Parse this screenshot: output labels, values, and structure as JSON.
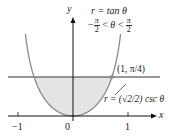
{
  "axes": {
    "x_label": "x",
    "y_label": "y",
    "x_ticks": [
      {
        "value": -1,
        "label": "−1"
      },
      {
        "value": 0,
        "label": "0"
      },
      {
        "value": 1,
        "label": "1"
      }
    ]
  },
  "curves": [
    {
      "name": "tan-curve",
      "equation_lhs": "r = tan",
      "theta": "θ",
      "domain_left": "−",
      "pi": "π",
      "two": "2",
      "lt": "<",
      "domain_theta": "θ",
      "color": "#8a8a8a"
    },
    {
      "name": "csc-line",
      "label": "r = (√2/2) csc θ",
      "color": "#333333"
    }
  ],
  "intersection": {
    "label": "(1, π/4)",
    "x": 0.7071,
    "y": 0.7071
  },
  "colors": {
    "shade": "#e4e4e4",
    "axis": "#111111",
    "curve": "#8a8a8a",
    "line": "#333333"
  }
}
